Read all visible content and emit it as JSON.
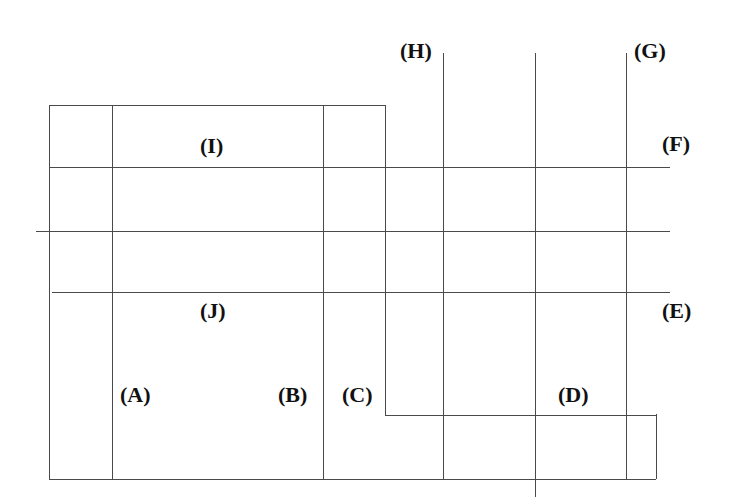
{
  "figure": {
    "title": "",
    "background_color": "#ffffff",
    "line_color": "#4a4a4a",
    "label_color": "#111111",
    "width": 735,
    "height": 504
  },
  "labels": [
    {
      "id": "H",
      "text": "(H)",
      "x": 400,
      "y": 40
    },
    {
      "id": "G",
      "text": "(G)",
      "x": 634,
      "y": 40
    },
    {
      "id": "I",
      "text": "(I)",
      "x": 200,
      "y": 135
    },
    {
      "id": "F",
      "text": "(F)",
      "x": 662,
      "y": 133
    },
    {
      "id": "J",
      "text": "(J)",
      "x": 200,
      "y": 300
    },
    {
      "id": "E",
      "text": "(E)",
      "x": 662,
      "y": 300
    },
    {
      "id": "A",
      "text": "(A)",
      "x": 120,
      "y": 384
    },
    {
      "id": "B",
      "text": "(B)",
      "x": 278,
      "y": 384
    },
    {
      "id": "C",
      "text": "(C)",
      "x": 342,
      "y": 384
    },
    {
      "id": "D",
      "text": "(D)",
      "x": 558,
      "y": 384
    }
  ],
  "horizontal_lines": [
    {
      "id": "h-top-box",
      "x1": 49,
      "x2": 385,
      "y": 105
    },
    {
      "id": "h-f-line",
      "x1": 49,
      "x2": 670,
      "y": 167
    },
    {
      "id": "h-middle-line",
      "x1": 36,
      "x2": 670,
      "y": 231
    },
    {
      "id": "h-e-line",
      "x1": 52,
      "x2": 670,
      "y": 292
    },
    {
      "id": "h-lower-step",
      "x1": 385,
      "x2": 656,
      "y": 415
    },
    {
      "id": "h-bottom",
      "x1": 49,
      "x2": 656,
      "y": 479
    }
  ],
  "vertical_lines": [
    {
      "id": "v-left-edge",
      "x": 49,
      "y1": 105,
      "y2": 479
    },
    {
      "id": "v-a-left",
      "x": 112,
      "y1": 105,
      "y2": 479
    },
    {
      "id": "v-b-right",
      "x": 323,
      "y1": 105,
      "y2": 479
    },
    {
      "id": "v-c-right",
      "x": 385,
      "y1": 105,
      "y2": 415
    },
    {
      "id": "v-h-line",
      "x": 443,
      "y1": 53,
      "y2": 479
    },
    {
      "id": "v-center-long",
      "x": 535,
      "y1": 53,
      "y2": 497
    },
    {
      "id": "v-g-line",
      "x": 626,
      "y1": 53,
      "y2": 479
    },
    {
      "id": "v-right-edge",
      "x": 656,
      "y1": 414,
      "y2": 479
    }
  ]
}
